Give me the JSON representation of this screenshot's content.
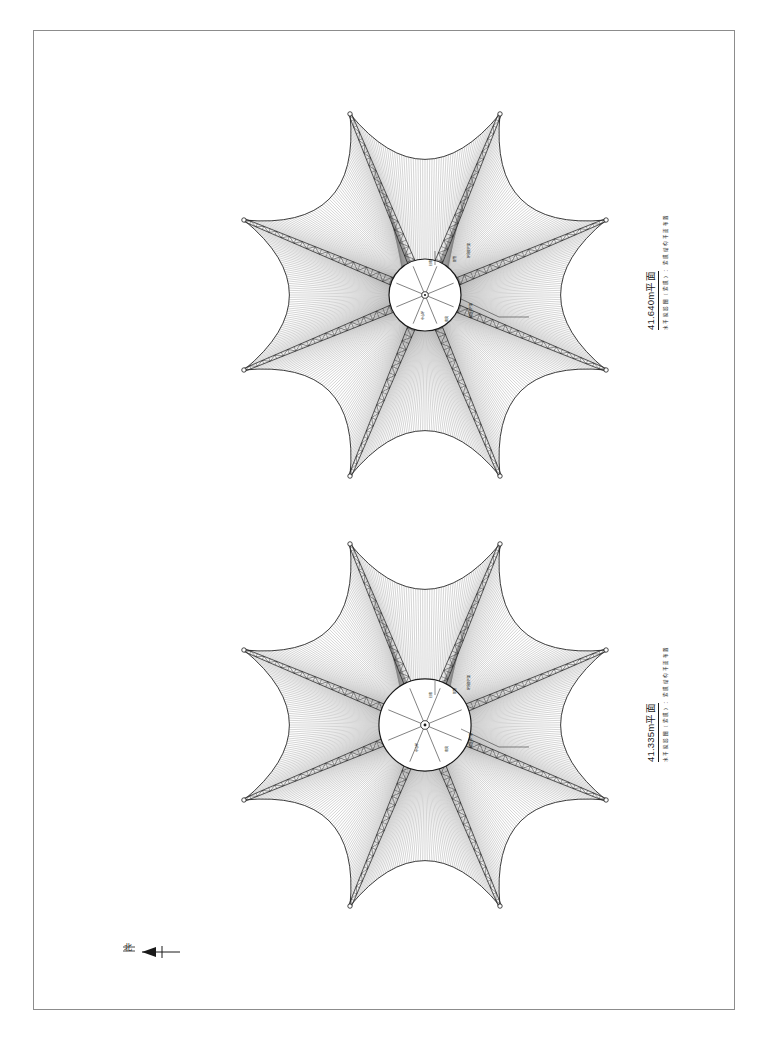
{
  "sheet": {
    "background_color": "#ffffff",
    "border_color": "#8c8c8c",
    "line_color": "#1a1a1a",
    "hatch_color": "#707070"
  },
  "north_indicator": {
    "label": "北",
    "name": "north-arrow",
    "direction": "left"
  },
  "plans": [
    {
      "id": "upper",
      "title": "41.640m平面",
      "subtitle": "水 平 投 影 图 （ 索 膜 ） ： 索 膜 结 构 平 面 布 置",
      "elevation": "41.640",
      "unit": "m",
      "arm_count": 8,
      "annotations": [
        {
          "text": "钢管",
          "x": 452,
          "y": 262,
          "size": "sm"
        },
        {
          "text": "环向钢桁架",
          "x": 466,
          "y": 258,
          "size": "sm"
        },
        {
          "text": "径向主桁架",
          "x": 468,
          "y": 318,
          "size": "sm"
        },
        {
          "text": "拉索",
          "x": 428,
          "y": 266,
          "size": "sm"
        },
        {
          "text": "中心环",
          "x": 420,
          "y": 320,
          "size": "sm"
        },
        {
          "text": "索夹",
          "x": 444,
          "y": 322,
          "size": "sm"
        }
      ]
    },
    {
      "id": "lower",
      "title": "41.335m平面",
      "subtitle": "水 平 投 影 图 （ 索 膜 ） ： 索 膜 结 构 平 面 布 置",
      "elevation": "41.335",
      "unit": "m",
      "arm_count": 8,
      "annotations": [
        {
          "text": "钢管",
          "x": 452,
          "y": 694,
          "size": "sm"
        },
        {
          "text": "环向钢桁架",
          "x": 466,
          "y": 690,
          "size": "sm"
        },
        {
          "text": "径向主桁架",
          "x": 468,
          "y": 748,
          "size": "sm"
        },
        {
          "text": "拉索",
          "x": 428,
          "y": 698,
          "size": "sm"
        },
        {
          "text": "中心环",
          "x": 414,
          "y": 752,
          "size": "sm"
        },
        {
          "text": "索夹",
          "x": 444,
          "y": 752,
          "size": "sm"
        }
      ]
    }
  ],
  "geometry": {
    "type": "radial-membrane-roof",
    "arms": 8,
    "arm_start_radius": 30,
    "arm_end_radius": 196,
    "petal_arc_sag": 0.46,
    "hub_rings": [
      14,
      20,
      26,
      31,
      36
    ],
    "hatch_line_count_per_petal": 64
  }
}
